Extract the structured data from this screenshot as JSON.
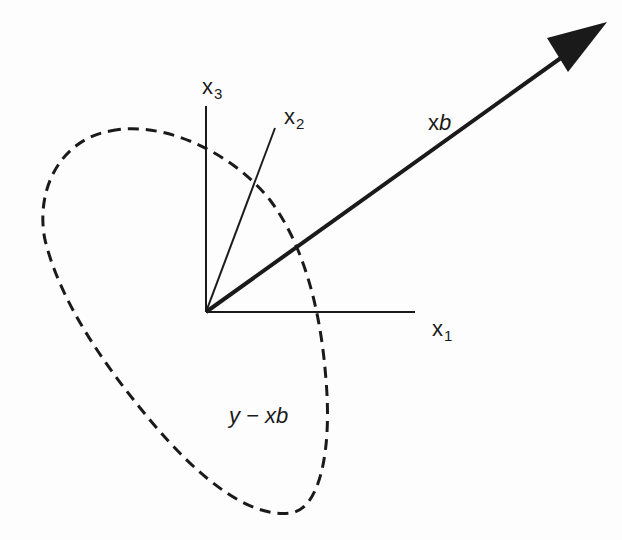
{
  "figure": {
    "colors": {
      "ink": "#1a1a1a",
      "background": "#fdfdfd"
    },
    "axes": {
      "x1": {
        "base": "x",
        "sub": "1"
      },
      "x2": {
        "base": "x",
        "sub": "2"
      },
      "x3": {
        "base": "x",
        "sub": "3"
      }
    },
    "vector": {
      "base": "x",
      "italic": "b"
    },
    "residual": {
      "prefix": "y − x",
      "italic": "b"
    }
  }
}
